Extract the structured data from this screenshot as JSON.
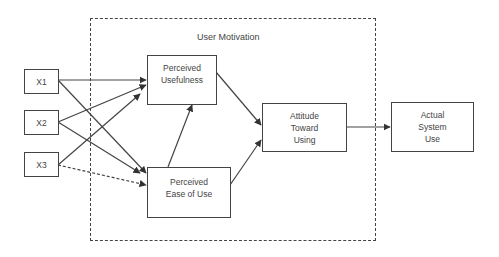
{
  "diagram": {
    "type": "flowchart",
    "title": "",
    "group": {
      "label": "User Motivation",
      "style": "dashed",
      "contains": [
        "pu",
        "peou",
        "atu"
      ]
    },
    "nodes": [
      {
        "id": "x1",
        "lines": [
          "X1"
        ]
      },
      {
        "id": "x2",
        "lines": [
          "X2"
        ]
      },
      {
        "id": "x3",
        "lines": [
          "X3"
        ]
      },
      {
        "id": "pu",
        "lines": [
          "Perceived",
          "Usefulness"
        ]
      },
      {
        "id": "peou",
        "lines": [
          "Perceived",
          "Ease of Use"
        ]
      },
      {
        "id": "atu",
        "lines": [
          "Attitude",
          "Toward",
          "Using"
        ]
      },
      {
        "id": "asu",
        "lines": [
          "Actual",
          "System",
          "Use"
        ]
      }
    ],
    "edges": [
      {
        "from": "x1",
        "to": "pu",
        "style": "solid"
      },
      {
        "from": "x1",
        "to": "peou",
        "style": "solid"
      },
      {
        "from": "x2",
        "to": "pu",
        "style": "solid"
      },
      {
        "from": "x2",
        "to": "peou",
        "style": "solid"
      },
      {
        "from": "x3",
        "to": "pu",
        "style": "solid"
      },
      {
        "from": "x3",
        "to": "peou",
        "style": "dashed"
      },
      {
        "from": "peou",
        "to": "pu",
        "style": "solid"
      },
      {
        "from": "pu",
        "to": "atu",
        "style": "solid"
      },
      {
        "from": "peou",
        "to": "atu",
        "style": "solid"
      },
      {
        "from": "atu",
        "to": "asu",
        "style": "solid"
      }
    ],
    "colors": {
      "stroke": "#444444",
      "background": "#ffffff"
    }
  }
}
